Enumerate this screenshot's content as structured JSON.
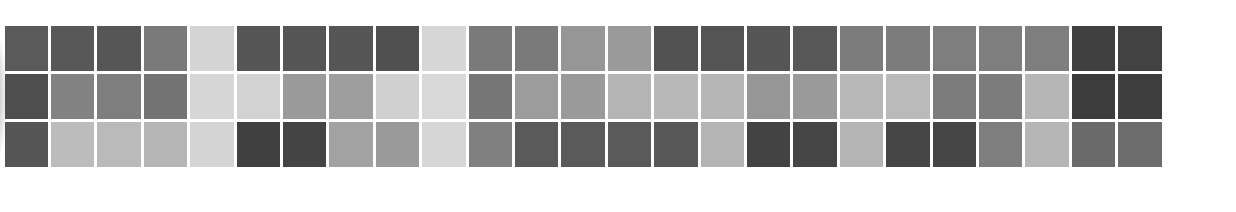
{
  "chart_data": {
    "type": "heatmap",
    "title": "",
    "xlabel": "",
    "ylabel": "",
    "grid": false,
    "legend": null,
    "rows": 3,
    "cols": 25,
    "colormap": "grayscale (darker = higher)",
    "values_gray_hex": [
      [
        "#5a5a5a",
        "#585858",
        "#565656",
        "#7a7a7a",
        "#d4d4d4",
        "#555555",
        "#555555",
        "#555555",
        "#505050",
        "#d6d6d6",
        "#7a7a7a",
        "#7a7a7a",
        "#969696",
        "#9a9a9a",
        "#525252",
        "#545454",
        "#555555",
        "#585858",
        "#7c7c7c",
        "#7c7c7c",
        "#7e7e7e",
        "#7e7e7e",
        "#7e7e7e",
        "#404040",
        "#424242"
      ],
      [
        "#4e4e4e",
        "#828282",
        "#7e7e7e",
        "#737373",
        "#d6d6d6",
        "#d2d2d2",
        "#9a9a9a",
        "#9e9e9e",
        "#d0d0d0",
        "#d8d8d8",
        "#767676",
        "#9c9c9c",
        "#9a9a9a",
        "#b4b4b4",
        "#b8b8b8",
        "#b6b6b6",
        "#969696",
        "#9a9a9a",
        "#b8b8b8",
        "#bababa",
        "#7c7c7c",
        "#7c7c7c",
        "#b6b6b6",
        "#3c3c3c",
        "#3e3e3e"
      ],
      [
        "#555555",
        "#bcbcbc",
        "#bababa",
        "#b6b6b6",
        "#d4d4d4",
        "#404040",
        "#444444",
        "#a2a2a2",
        "#9a9a9a",
        "#d6d6d6",
        "#808080",
        "#5a5a5a",
        "#5a5a5a",
        "#5a5a5a",
        "#585858",
        "#b4b4b4",
        "#434343",
        "#454545",
        "#b4b4b4",
        "#454545",
        "#454545",
        "#7e7e7e",
        "#b6b6b6",
        "#6a6a6a",
        "#6c6c6c"
      ]
    ],
    "layout": {
      "origin_x": 4.5,
      "origin_y": 26,
      "col_pitch": 46.4,
      "row_pitch": 48,
      "cell_w": 43.5,
      "cell_h": 45
    }
  }
}
